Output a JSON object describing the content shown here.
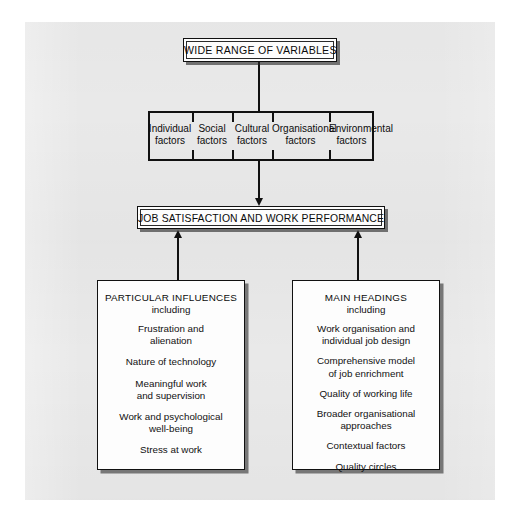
{
  "diagram": {
    "title_box": {
      "label": "WIDE RANGE OF VARIABLES"
    },
    "factors": [
      {
        "line1": "Individual",
        "line2": "factors"
      },
      {
        "line1": "Social",
        "line2": "factors"
      },
      {
        "line1": "Cultural",
        "line2": "factors"
      },
      {
        "line1": "Organisational",
        "line2": "factors"
      },
      {
        "line1": "Environmental",
        "line2": "factors"
      }
    ],
    "middle_box": {
      "label": "JOB SATISFACTION AND WORK PERFORMANCE"
    },
    "panel_left": {
      "heading": "PARTICULAR INFLUENCES",
      "subheading": "including",
      "items": [
        "Frustration and\nalienation",
        "Nature of technology",
        "Meaningful work\nand supervision",
        "Work and psychological\nwell-being",
        "Stress at work"
      ]
    },
    "panel_right": {
      "heading": "MAIN HEADINGS",
      "subheading": "including",
      "items": [
        "Work organisation and\nindividual job design",
        "Comprehensive model\nof job enrichment",
        "Quality of working life",
        "Broader organisational\napproaches",
        "Contextual factors",
        "Quality circles"
      ]
    },
    "colors": {
      "page_background": "#e9e9e9",
      "box_fill": "#fdfdfd",
      "line": "#111111",
      "shadow": "#2d2d2d"
    }
  }
}
